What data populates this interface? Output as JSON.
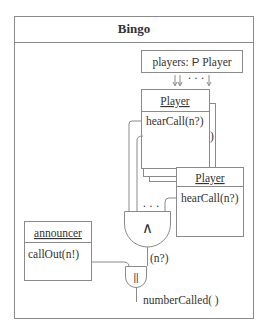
{
  "diagram": {
    "title": "Bingo",
    "players_set": {
      "name": "players:",
      "type_symbol": "P",
      "type": "Player"
    },
    "player_objects": [
      {
        "class": "Player",
        "operation": "hearCall(n?)"
      },
      {
        "class": "Player",
        "operation": "hearCall(n?)"
      }
    ],
    "back_stack_fragment": ")",
    "arrows_ellipsis": "· · ·",
    "and_gate": {
      "symbol": "∧",
      "inputs_ellipsis": "· · ·"
    },
    "and_output_label": "(n?)",
    "parallel_gate": {
      "symbol": "||"
    },
    "announcer": {
      "class": "announcer",
      "operation": "callOut(n!)"
    },
    "output_operation": "numberCalled( )"
  }
}
